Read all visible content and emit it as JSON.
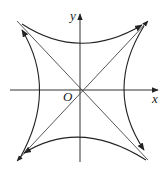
{
  "diagram": {
    "labels": {
      "x_axis": "x",
      "y_axis": "y",
      "origin": "O"
    },
    "curves": [
      {
        "name": "hyperbola-x2-y2",
        "equation": "x^2 - y^2 = a^2",
        "branches": [
          "left",
          "right"
        ]
      },
      {
        "name": "hyperbola-y2-x2",
        "equation": "y^2 - x^2 = a^2",
        "branches": [
          "top",
          "bottom"
        ]
      }
    ],
    "asymptotes": [
      "y = x",
      "y = -x"
    ],
    "colors": {
      "stroke": "#222222",
      "background": "#ffffff"
    }
  }
}
